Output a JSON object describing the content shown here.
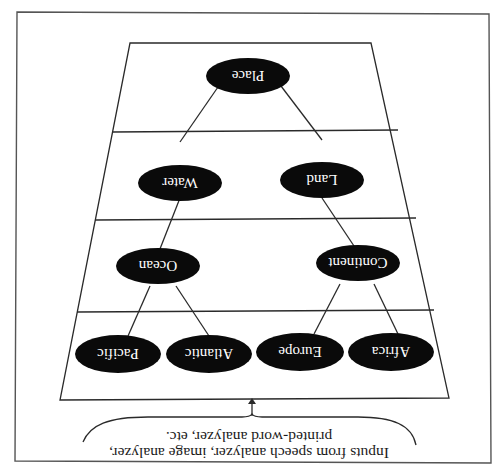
{
  "diagram": {
    "orientation": "rotated 180 degrees",
    "colors": {
      "node_fill": "#0a0a0a",
      "node_text": "#ffffff",
      "lines": "#2a2a2a",
      "background": "#ffffff"
    },
    "levels": [
      {
        "nodes": [
          "Place"
        ]
      },
      {
        "nodes": [
          "Land",
          "Water"
        ]
      },
      {
        "nodes": [
          "Continent",
          "Ocean"
        ]
      },
      {
        "nodes": [
          "Africa",
          "Europe",
          "Atlantic",
          "Pacific"
        ]
      }
    ],
    "nodes": {
      "place": "Place",
      "land": "Land",
      "water": "Water",
      "continent": "Continent",
      "ocean": "Ocean",
      "africa": "Africa",
      "europe": "Europe",
      "atlantic": "Atlantic",
      "pacific": "Pacific"
    },
    "edges": [
      [
        "Place",
        "Land"
      ],
      [
        "Place",
        "Water"
      ],
      [
        "Land",
        "Continent"
      ],
      [
        "Water",
        "Ocean"
      ],
      [
        "Continent",
        "Africa"
      ],
      [
        "Continent",
        "Europe"
      ],
      [
        "Ocean",
        "Atlantic"
      ],
      [
        "Ocean",
        "Pacific"
      ]
    ],
    "caption": {
      "line1": "Inputs from speech analyzer, image analyzer,",
      "line2": "printed-word analyzer, etc."
    }
  }
}
